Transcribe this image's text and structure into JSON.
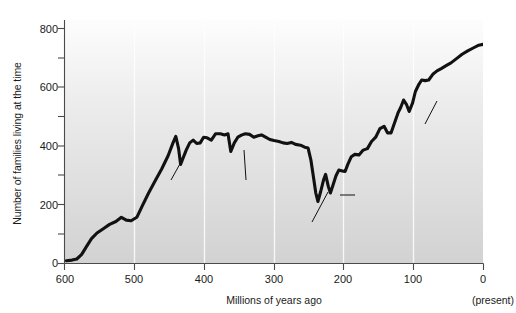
{
  "chart_data": {
    "type": "line",
    "title": "",
    "xlabel": "Millions of years ago",
    "ylabel": "Number of families living at the time",
    "xlim": [
      600,
      0
    ],
    "ylim": [
      0,
      850
    ],
    "x_reversed": true,
    "grid": "vertical-light",
    "xticks": [
      600,
      500,
      400,
      300,
      200,
      100,
      0
    ],
    "xtick_labels": [
      "600",
      "500",
      "400",
      "300",
      "200",
      "100",
      "0"
    ],
    "yticks": [
      0,
      200,
      400,
      600,
      800
    ],
    "ytick_labels": [
      "0",
      "200",
      "400",
      "600",
      "800"
    ],
    "y_minor_ticks": [
      100,
      300,
      500,
      700
    ],
    "present_note": "(present)",
    "series": [
      {
        "name": "Marine animal families",
        "color": "#111111",
        "points": [
          [
            598,
            8
          ],
          [
            590,
            10
          ],
          [
            583,
            14
          ],
          [
            576,
            30
          ],
          [
            569,
            58
          ],
          [
            562,
            85
          ],
          [
            554,
            105
          ],
          [
            545,
            120
          ],
          [
            536,
            135
          ],
          [
            527,
            145
          ],
          [
            519,
            160
          ],
          [
            512,
            150
          ],
          [
            505,
            148
          ],
          [
            497,
            160
          ],
          [
            489,
            200
          ],
          [
            480,
            245
          ],
          [
            470,
            290
          ],
          [
            461,
            330
          ],
          [
            452,
            375
          ],
          [
            445,
            420
          ],
          [
            441,
            443
          ],
          [
            437,
            400
          ],
          [
            434,
            345
          ],
          [
            430,
            370
          ],
          [
            426,
            395
          ],
          [
            421,
            420
          ],
          [
            416,
            430
          ],
          [
            411,
            418
          ],
          [
            406,
            420
          ],
          [
            401,
            440
          ],
          [
            396,
            438
          ],
          [
            390,
            430
          ],
          [
            384,
            452
          ],
          [
            377,
            452
          ],
          [
            371,
            448
          ],
          [
            366,
            452
          ],
          [
            362,
            390
          ],
          [
            357,
            420
          ],
          [
            352,
            440
          ],
          [
            346,
            448
          ],
          [
            341,
            452
          ],
          [
            335,
            450
          ],
          [
            329,
            440
          ],
          [
            323,
            445
          ],
          [
            318,
            448
          ],
          [
            312,
            440
          ],
          [
            306,
            432
          ],
          [
            300,
            428
          ],
          [
            293,
            425
          ],
          [
            287,
            420
          ],
          [
            281,
            418
          ],
          [
            275,
            422
          ],
          [
            269,
            415
          ],
          [
            262,
            412
          ],
          [
            256,
            405
          ],
          [
            251,
            402
          ],
          [
            247,
            360
          ],
          [
            243,
            295
          ],
          [
            240,
            245
          ],
          [
            237,
            215
          ],
          [
            233,
            250
          ],
          [
            229,
            290
          ],
          [
            226,
            310
          ],
          [
            222,
            268
          ],
          [
            219,
            245
          ],
          [
            215,
            275
          ],
          [
            211,
            305
          ],
          [
            207,
            325
          ],
          [
            202,
            322
          ],
          [
            198,
            320
          ],
          [
            194,
            345
          ],
          [
            189,
            372
          ],
          [
            184,
            380
          ],
          [
            178,
            378
          ],
          [
            172,
            395
          ],
          [
            166,
            400
          ],
          [
            160,
            425
          ],
          [
            154,
            440
          ],
          [
            148,
            470
          ],
          [
            142,
            478
          ],
          [
            137,
            455
          ],
          [
            132,
            455
          ],
          [
            127,
            490
          ],
          [
            122,
            525
          ],
          [
            118,
            545
          ],
          [
            114,
            570
          ],
          [
            110,
            555
          ],
          [
            106,
            530
          ],
          [
            101,
            560
          ],
          [
            97,
            600
          ],
          [
            92,
            625
          ],
          [
            88,
            640
          ],
          [
            83,
            638
          ],
          [
            78,
            640
          ],
          [
            72,
            660
          ],
          [
            66,
            672
          ],
          [
            60,
            680
          ],
          [
            53,
            690
          ],
          [
            46,
            700
          ],
          [
            38,
            715
          ],
          [
            30,
            730
          ],
          [
            22,
            742
          ],
          [
            14,
            752
          ],
          [
            6,
            762
          ],
          [
            0,
            765
          ]
        ]
      }
    ],
    "annotations": [
      {
        "id": "ordovician",
        "text": "Ordovician\nextinction",
        "label_x_px": 164,
        "label_y_px": 183,
        "leader": [
          [
            186,
            153
          ],
          [
            171,
            180
          ]
        ]
      },
      {
        "id": "devonian",
        "text": "Devonian\nextinction",
        "label_x_px": 238,
        "label_y_px": 183,
        "leader": [
          [
            244,
            150
          ],
          [
            246,
            180
          ]
        ]
      },
      {
        "id": "permo-triassic",
        "text": "Permo-Triassic\nextinction",
        "label_x_px": 292,
        "label_y_px": 226,
        "leader": [
          [
            328,
            192
          ],
          [
            312,
            222
          ]
        ]
      },
      {
        "id": "end-triassic",
        "text": "End-Triassic\nextinction",
        "label_x_px": 357,
        "label_y_px": 190,
        "leader": [
          [
            340,
            195
          ],
          [
            355,
            195
          ]
        ]
      },
      {
        "id": "cretaceous-tertiary",
        "text": "Cretaceous-\nTertiary\nextinction",
        "label_x_px": 414,
        "label_y_px": 128,
        "leader": [
          [
            437,
            101
          ],
          [
            425,
            124
          ]
        ]
      }
    ]
  }
}
